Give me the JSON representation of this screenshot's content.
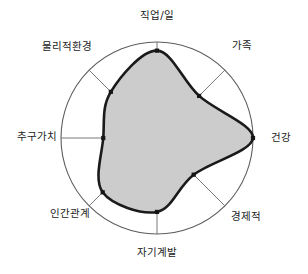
{
  "chart_data": {
    "type": "radar",
    "title": "",
    "subtitle": "",
    "xlabel": "",
    "ylabel": "",
    "grid": false,
    "legend": "none",
    "rlim": [
      0,
      100
    ],
    "categories": [
      "직업/일",
      "가족",
      "건강",
      "경제적",
      "자기계발",
      "인간관계",
      "추구가치",
      "물리적환경"
    ],
    "values": [
      91,
      62,
      100,
      54,
      77,
      80,
      56,
      68
    ],
    "series": [
      {
        "name": "",
        "values": [
          91,
          62,
          100,
          54,
          77,
          80,
          56,
          68
        ]
      }
    ],
    "axis_angles_deg": [
      270,
      315,
      0,
      45,
      90,
      135,
      180,
      225
    ],
    "style": {
      "fill_color": "#cccccc",
      "line_color": "#1a1a1a",
      "marker_color": "#151515",
      "ring_color": "#5d5d5d",
      "spoke_color": "#6b6b6b",
      "background": "#ffffff"
    },
    "geometry": {
      "center_x": 157,
      "center_y": 138,
      "radius": 96
    }
  },
  "labels": {
    "top": "직업/일",
    "top_right": "가족",
    "right": "건강",
    "bottom_right": "경제적",
    "bottom": "자기계발",
    "bottom_left": "인간관계",
    "left": "추구가치",
    "top_left": "물리적환경"
  }
}
